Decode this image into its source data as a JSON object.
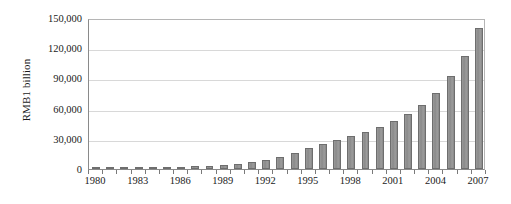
{
  "chart_data": {
    "type": "bar",
    "title": "",
    "xlabel": "",
    "ylabel": "RMB1 billion",
    "ylim": [
      0,
      150000
    ],
    "ytick_labels": [
      "150,000",
      "120,000",
      "90,000",
      "60,000",
      "30,000",
      "0"
    ],
    "ytick_values": [
      150000,
      120000,
      90000,
      60000,
      30000,
      0
    ],
    "ytick_interval": 30000,
    "grid": true,
    "grid_axis": "y",
    "legend": "none",
    "bar_color": "#8c8c8c",
    "bar_edge_color": "#6e6e6e",
    "gridline_color": "#d8d8d8",
    "axis_color": "#8a8a8a",
    "xtick_labels": [
      "1980",
      "1983",
      "1986",
      "1989",
      "1992",
      "1995",
      "1998",
      "2001",
      "2004",
      "2007"
    ],
    "xtick_label_interval": 3,
    "categories": [
      "1980",
      "1981",
      "1982",
      "1983",
      "1984",
      "1985",
      "1986",
      "1987",
      "1988",
      "1989",
      "1990",
      "1991",
      "1992",
      "1993",
      "1994",
      "1995",
      "1996",
      "1997",
      "1998",
      "1999",
      "2000",
      "2001",
      "2002",
      "2003",
      "2004",
      "2005",
      "2006",
      "2007"
    ],
    "values": [
      450,
      600,
      750,
      900,
      1200,
      1600,
      2100,
      2700,
      3400,
      4200,
      5400,
      7100,
      9200,
      12000,
      16000,
      20500,
      25000,
      29000,
      33000,
      37000,
      42000,
      48000,
      55000,
      64000,
      76000,
      92000,
      112000,
      140000
    ]
  }
}
